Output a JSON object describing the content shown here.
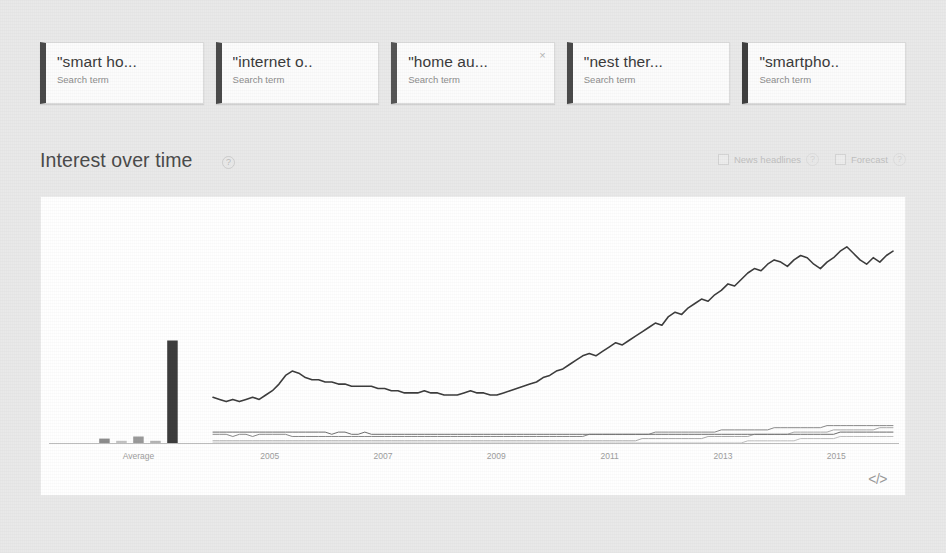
{
  "search_terms": [
    {
      "title": "\"smart ho...",
      "subtitle": "Search term",
      "color": "#4a4a4a",
      "closable": false,
      "close_label": ""
    },
    {
      "title": "\"internet o..",
      "subtitle": "Search term",
      "color": "#4a4a4a",
      "closable": false,
      "close_label": ""
    },
    {
      "title": "\"home au...",
      "subtitle": "Search term",
      "color": "#565656",
      "closable": true,
      "close_label": "×"
    },
    {
      "title": "\"nest ther...",
      "subtitle": "Search term",
      "color": "#4a4a4a",
      "closable": false,
      "close_label": ""
    },
    {
      "title": "\"smartpho..",
      "subtitle": "Search term",
      "color": "#3f3f3f",
      "closable": false,
      "close_label": ""
    }
  ],
  "section": {
    "title": "Interest over time",
    "help_label": "?",
    "controls": [
      {
        "label": "News headlines",
        "help_label": "?",
        "checked": false
      },
      {
        "label": "Forecast",
        "help_label": "?",
        "checked": false
      }
    ]
  },
  "chart_footer": {
    "embed_label": "</>"
  },
  "chart_data": {
    "type": "line",
    "title": "Interest over time",
    "xlabel": "",
    "ylabel": "",
    "ylim": [
      0,
      100
    ],
    "grid": false,
    "legend": "none",
    "average_group": {
      "label": "Average",
      "type": "bar",
      "categories": [
        "\"smart ho...",
        "\"internet o..",
        "\"home au...",
        "\"nest ther...",
        "\"smartpho.."
      ],
      "values": [
        2,
        1,
        3,
        1,
        47
      ],
      "colors": [
        "#8d8d8d",
        "#c4c4c4",
        "#9a9a9a",
        "#b5b5b5",
        "#3d3d3d"
      ]
    },
    "tick_labels": [
      "Average",
      "2005",
      "2007",
      "2009",
      "2011",
      "2013",
      "2015"
    ],
    "x_start_year": 2004,
    "x_end_year": 2016,
    "series": [
      {
        "name": "\"smartpho..",
        "color": "#3d3d3d",
        "width": 1.6,
        "values": [
          21,
          20,
          19,
          20,
          19,
          20,
          21,
          20,
          22,
          24,
          27,
          31,
          33,
          32,
          30,
          29,
          29,
          28,
          28,
          27,
          27,
          26,
          26,
          26,
          26,
          25,
          25,
          24,
          24,
          23,
          23,
          23,
          24,
          23,
          23,
          22,
          22,
          22,
          23,
          24,
          23,
          23,
          22,
          22,
          23,
          24,
          25,
          26,
          27,
          28,
          30,
          31,
          33,
          34,
          36,
          38,
          40,
          41,
          40,
          42,
          44,
          46,
          45,
          47,
          49,
          51,
          53,
          55,
          54,
          58,
          60,
          59,
          62,
          64,
          66,
          65,
          68,
          70,
          73,
          72,
          75,
          78,
          80,
          79,
          82,
          84,
          83,
          81,
          84,
          86,
          85,
          82,
          80,
          83,
          85,
          88,
          90,
          87,
          84,
          82,
          85,
          83,
          86,
          88
        ]
      },
      {
        "name": "\"smart ho...",
        "color": "#8a8a8a",
        "width": 1.0,
        "values": [
          4,
          4,
          4,
          3,
          4,
          4,
          3,
          4,
          4,
          4,
          4,
          4,
          3,
          3,
          3,
          3,
          3,
          3,
          3,
          3,
          3,
          3,
          3,
          3,
          3,
          3,
          3,
          3,
          3,
          3,
          3,
          3,
          3,
          3,
          3,
          3,
          3,
          3,
          3,
          3,
          3,
          3,
          3,
          3,
          3,
          3,
          3,
          3,
          3,
          3,
          3,
          3,
          3,
          3,
          3,
          3,
          3,
          4,
          4,
          4,
          4,
          4,
          4,
          4,
          4,
          4,
          4,
          5,
          5,
          5,
          5,
          5,
          5,
          5,
          5,
          5,
          5,
          6,
          6,
          6,
          6,
          6,
          6,
          6,
          6,
          7,
          7,
          7,
          7,
          7,
          7,
          7,
          7,
          8,
          8,
          8,
          8,
          8,
          8,
          8,
          8,
          8,
          8,
          8
        ]
      },
      {
        "name": "\"internet o..",
        "color": "#ababab",
        "width": 1.0,
        "values": [
          1,
          1,
          1,
          1,
          1,
          1,
          1,
          1,
          1,
          1,
          1,
          1,
          1,
          1,
          1,
          1,
          1,
          1,
          1,
          1,
          1,
          1,
          1,
          1,
          1,
          1,
          1,
          1,
          1,
          1,
          1,
          1,
          1,
          1,
          1,
          1,
          1,
          1,
          1,
          1,
          1,
          1,
          1,
          1,
          1,
          1,
          1,
          1,
          1,
          1,
          1,
          1,
          1,
          1,
          1,
          1,
          1,
          1,
          1,
          1,
          1,
          1,
          1,
          1,
          1,
          2,
          2,
          2,
          2,
          2,
          2,
          2,
          2,
          2,
          2,
          3,
          3,
          3,
          3,
          3,
          3,
          3,
          4,
          4,
          4,
          4,
          4,
          4,
          5,
          5,
          5,
          5,
          5,
          5,
          6,
          6,
          6,
          6,
          6,
          6,
          6,
          7,
          7,
          7
        ]
      },
      {
        "name": "\"home au...",
        "color": "#6e6e6e",
        "width": 1.0,
        "values": [
          5,
          5,
          5,
          5,
          5,
          5,
          5,
          5,
          5,
          5,
          5,
          5,
          5,
          5,
          5,
          5,
          5,
          5,
          4,
          5,
          5,
          4,
          4,
          5,
          4,
          4,
          4,
          4,
          4,
          4,
          4,
          4,
          4,
          4,
          4,
          4,
          4,
          4,
          4,
          4,
          4,
          4,
          4,
          4,
          4,
          4,
          4,
          4,
          4,
          4,
          4,
          4,
          4,
          4,
          4,
          4,
          4,
          4,
          4,
          4,
          4,
          4,
          4,
          4,
          4,
          4,
          4,
          4,
          4,
          4,
          4,
          4,
          4,
          4,
          4,
          4,
          4,
          4,
          4,
          4,
          4,
          4,
          4,
          4,
          4,
          4,
          4,
          4,
          4,
          4,
          4,
          4,
          4,
          4,
          4,
          5,
          5,
          5,
          5,
          5,
          5,
          5,
          5,
          5
        ]
      },
      {
        "name": "\"nest ther...",
        "color": "#c0c0c0",
        "width": 1.0,
        "values": [
          0,
          0,
          0,
          0,
          0,
          0,
          0,
          0,
          0,
          0,
          0,
          0,
          0,
          0,
          0,
          0,
          0,
          0,
          0,
          0,
          0,
          0,
          0,
          0,
          0,
          0,
          0,
          0,
          0,
          0,
          0,
          0,
          0,
          0,
          0,
          0,
          0,
          0,
          0,
          0,
          0,
          0,
          0,
          0,
          0,
          0,
          0,
          0,
          0,
          0,
          0,
          0,
          0,
          0,
          0,
          0,
          0,
          0,
          0,
          0,
          0,
          0,
          0,
          0,
          0,
          0,
          0,
          0,
          0,
          0,
          0,
          0,
          0,
          0,
          0,
          0,
          0,
          0,
          0,
          0,
          0,
          1,
          1,
          1,
          1,
          1,
          1,
          1,
          1,
          2,
          2,
          2,
          2,
          2,
          2,
          3,
          3,
          3,
          3,
          3,
          3,
          3,
          3,
          3
        ]
      }
    ]
  }
}
